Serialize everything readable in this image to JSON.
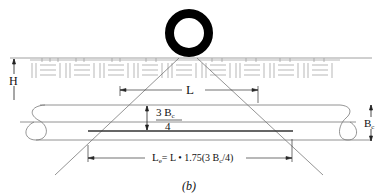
{
  "diagram": {
    "caption": "(b)",
    "labels": {
      "H": "H",
      "L": "L",
      "frac_num_3": "3",
      "frac_num_B": "B",
      "frac_num_sub": "c",
      "frac_den": "4",
      "Bc_main": "B",
      "Bc_sub": "c",
      "Le_main": "L",
      "Le_sub": "e",
      "Le_rhs_1": "= L • 1.75(3 B",
      "Le_rhs_sub": "c",
      "Le_rhs_2": "/4)"
    },
    "elements": [
      "wheel-load",
      "pavement-layer",
      "fill-depth-H",
      "load-spread-lines",
      "pipe",
      "effective-length-Le"
    ],
    "colors": {
      "ink": "#111111",
      "light_line": "#8a8a8a",
      "wheel": "#000000"
    }
  }
}
